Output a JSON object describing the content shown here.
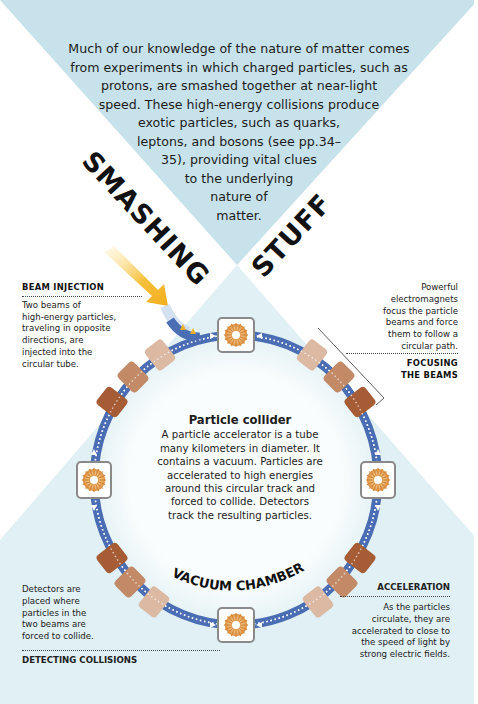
{
  "intro": {
    "lines": [
      "Much of our knowledge of the nature of matter comes",
      "from experiments in which charged particles, such as",
      "protons, are smashed together at near-light",
      "speed. These high-energy collisions produce",
      "exotic particles, such as quarks,",
      "leptons, and bosons (see pp.34–",
      "35), providing vital clues",
      "to the underlying",
      "nature of",
      "matter."
    ]
  },
  "title": {
    "word1": "SMASHING",
    "word2": "STUFF"
  },
  "labels": {
    "beam_injection": {
      "heading": "BEAM INJECTION",
      "lines": [
        "Two beams of",
        "high-energy particles,",
        "traveling in opposite",
        "directions, are",
        "injected into the",
        "circular tube."
      ]
    },
    "focusing": {
      "heading_lines": [
        "FOCUSING",
        "THE BEAMS"
      ],
      "lines": [
        "Powerful",
        "electromagnets",
        "focus the particle",
        "beams and force",
        "them to follow a",
        "circular path."
      ]
    },
    "detecting": {
      "heading": "DETECTING COLLISIONS",
      "lines": [
        "Detectors are",
        "placed where",
        "particles in the",
        "two beams are",
        "forced to collide."
      ]
    },
    "acceleration": {
      "heading": "ACCELERATION",
      "lines": [
        "As the particles",
        "circulate, they are",
        "accelerated to close to",
        "the speed of light by",
        "strong electric fields."
      ]
    }
  },
  "center": {
    "title": "Particle collider",
    "lines": [
      "A particle accelerator is a tube",
      "many kilometers in diameter. It",
      "contains a vacuum. Particles are",
      "accelerated to high energies",
      "around this circular track and",
      "forced to collide. Detectors",
      "track the resulting particles."
    ]
  },
  "ring_label": "VACUUM CHAMBER",
  "icons": {
    "detector": "starburst-icon",
    "magnet": "electromagnet-block",
    "injection": "yellow-arrow-icon"
  },
  "colors": {
    "top_triangle": "#c7e2ea",
    "bottom_bg": "#e0f0f4",
    "ring": "#4a6db3",
    "magnet_light": "#dcb9a2",
    "magnet_mid": "#c38a68",
    "magnet_dark": "#a65d36",
    "arrow": "#f5b82e",
    "detector_border": "#8a8a8a"
  }
}
